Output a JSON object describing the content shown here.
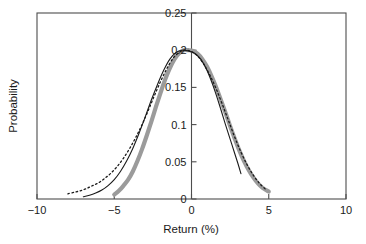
{
  "chart_data": {
    "type": "line",
    "title": "",
    "xlabel": "Return (%)",
    "ylabel": "Probability",
    "xlim": [
      -10,
      10
    ],
    "ylim": [
      0,
      0.25
    ],
    "grid": false,
    "legend": "none",
    "x_ticks": [
      -10,
      -5,
      0,
      5,
      10
    ],
    "x_tick_labels": [
      "−10",
      "−5",
      "0",
      "5",
      "10"
    ],
    "y_ticks": [
      0,
      0.05,
      0.1,
      0.15,
      0.2,
      0.25
    ],
    "y_tick_labels": [
      "0",
      "0.05",
      "0.1",
      "0.15",
      "0.2",
      "0.25"
    ],
    "y_axis_position": "center-at-x-0",
    "series": [
      {
        "name": "empirical-thick-gray",
        "style": "solid-thick",
        "color": "#9b9b9b",
        "x": [
          -5.0,
          -4.7,
          -4.4,
          -4.1,
          -3.8,
          -3.5,
          -3.2,
          -2.9,
          -2.6,
          -2.3,
          -2.0,
          -1.7,
          -1.4,
          -1.1,
          -0.8,
          -0.5,
          -0.2,
          0.1,
          0.4,
          0.7,
          1.0,
          1.3,
          1.6,
          1.9,
          2.2,
          2.5,
          2.8,
          3.1,
          3.4,
          3.7,
          4.0,
          4.3,
          4.6,
          5.0
        ],
        "y": [
          0.006,
          0.011,
          0.018,
          0.026,
          0.037,
          0.051,
          0.067,
          0.085,
          0.104,
          0.124,
          0.143,
          0.161,
          0.176,
          0.188,
          0.196,
          0.2,
          0.2,
          0.199,
          0.195,
          0.188,
          0.178,
          0.165,
          0.15,
          0.133,
          0.116,
          0.098,
          0.081,
          0.065,
          0.051,
          0.039,
          0.029,
          0.021,
          0.015,
          0.01
        ]
      },
      {
        "name": "model-thin-solid-black",
        "style": "solid-thin",
        "color": "#1a1a1a",
        "x": [
          -7.0,
          -6.6,
          -6.2,
          -5.8,
          -5.4,
          -5.0,
          -4.6,
          -4.2,
          -3.8,
          -3.4,
          -3.0,
          -2.6,
          -2.2,
          -1.8,
          -1.4,
          -1.0,
          -0.6,
          -0.2,
          0.2,
          0.6,
          1.0,
          1.4,
          1.8,
          2.2,
          2.6,
          3.0,
          3.2
        ],
        "y": [
          0.003,
          0.005,
          0.008,
          0.012,
          0.018,
          0.026,
          0.037,
          0.051,
          0.068,
          0.088,
          0.11,
          0.133,
          0.154,
          0.173,
          0.188,
          0.197,
          0.2,
          0.199,
          0.196,
          0.188,
          0.173,
          0.152,
          0.127,
          0.1,
          0.074,
          0.048,
          0.034
        ]
      },
      {
        "name": "fit-dotted-black",
        "style": "dotted",
        "color": "#1a1a1a",
        "x": [
          -8.0,
          -7.6,
          -7.2,
          -6.8,
          -6.4,
          -6.0,
          -5.6,
          -5.2,
          -4.8,
          -4.4,
          -4.0,
          -3.6,
          -3.2,
          -2.8,
          -2.4,
          -2.0,
          -1.6,
          -1.2,
          -0.8,
          -0.4,
          0.0,
          0.4,
          0.8,
          1.2,
          1.6,
          2.0,
          2.4,
          2.8,
          3.2,
          3.6,
          4.0,
          4.4,
          4.8
        ],
        "y": [
          0.007,
          0.009,
          0.011,
          0.014,
          0.018,
          0.022,
          0.028,
          0.035,
          0.044,
          0.055,
          0.068,
          0.083,
          0.1,
          0.119,
          0.139,
          0.158,
          0.175,
          0.189,
          0.197,
          0.2,
          0.198,
          0.192,
          0.181,
          0.166,
          0.148,
          0.127,
          0.105,
          0.083,
          0.063,
          0.046,
          0.032,
          0.021,
          0.013
        ]
      }
    ]
  }
}
